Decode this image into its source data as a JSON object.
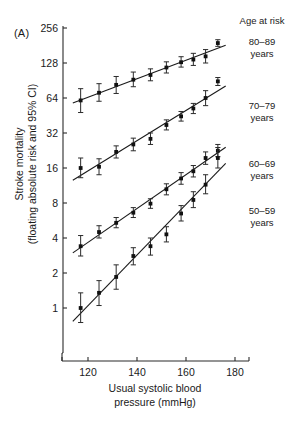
{
  "figure": {
    "panel_label": "(A)",
    "background": "#ffffff",
    "ink_color": "#1a1a1a"
  },
  "legend": {
    "title": "Age at risk",
    "position": "right",
    "entries": [
      {
        "age_range": "80–89",
        "unit": "years",
        "label_top": 36
      },
      {
        "age_range": "70–79",
        "unit": "years",
        "label_top": 100
      },
      {
        "age_range": "60–69",
        "unit": "years",
        "label_top": 158
      },
      {
        "age_range": "50–59",
        "unit": "years",
        "label_top": 205
      }
    ]
  },
  "chart_data": {
    "type": "scatter",
    "title": "",
    "subtitle": "",
    "xlabel_line1": "Usual systolic blood",
    "xlabel_line2": "pressure (mmHg)",
    "ylabel_line1": "Stroke mortality",
    "ylabel_line2": "(floating absolute risk and 95% CI)",
    "xlim": [
      112,
      188
    ],
    "ylim": [
      0.62,
      300
    ],
    "yscale": "log2",
    "xticks": [
      120,
      140,
      160,
      180
    ],
    "yticks": [
      1,
      2,
      4,
      8,
      16,
      32,
      64,
      128,
      256
    ],
    "ytick_labels": [
      "1",
      "2",
      "4",
      "8",
      "16",
      "32",
      "64",
      "128",
      "256"
    ],
    "grid": false,
    "legend_position": "right",
    "errorbar": "95% CI",
    "series": [
      {
        "name": "80–89 years",
        "x": [
          117,
          124.5,
          131.5,
          138.5,
          145.5,
          152,
          158,
          163,
          168,
          173
        ],
        "values": [
          61,
          71,
          83,
          92,
          101,
          117,
          130,
          137,
          146,
          190
        ],
        "ci_low": [
          48,
          60,
          70,
          80,
          90,
          105,
          118,
          122,
          128,
          178
        ],
        "ci_high": [
          77,
          85,
          98,
          107,
          114,
          131,
          145,
          155,
          167,
          203
        ]
      },
      {
        "name": "70–79 years",
        "x": [
          117,
          124.5,
          131.5,
          138.5,
          145.5,
          152,
          158,
          163,
          168,
          173
        ],
        "values": [
          16.0,
          16.4,
          22.0,
          25.5,
          28.5,
          37.5,
          44.5,
          52.0,
          64.0,
          89.0
        ],
        "ci_low": [
          13.2,
          14.0,
          19.5,
          22.5,
          25.5,
          34.0,
          40.5,
          47.0,
          55.0,
          82.0
        ],
        "ci_high": [
          19.5,
          19.2,
          24.8,
          28.9,
          32.0,
          41.5,
          49.0,
          57.5,
          74.0,
          96.0
        ]
      },
      {
        "name": "60–69 years",
        "x": [
          117,
          124.5,
          131.5,
          138.5,
          145.5,
          152,
          158,
          163,
          168,
          173
        ],
        "values": [
          3.4,
          4.5,
          5.4,
          6.6,
          7.9,
          10.5,
          13.0,
          15.0,
          19.5,
          22.5
        ],
        "ci_low": [
          2.8,
          4.0,
          4.9,
          6.0,
          7.2,
          9.4,
          11.6,
          13.4,
          17.2,
          20.0
        ],
        "ci_high": [
          4.2,
          5.1,
          6.0,
          7.3,
          8.7,
          11.7,
          14.6,
          16.8,
          22.0,
          25.5
        ]
      },
      {
        "name": "50–59 years",
        "x": [
          117,
          124.5,
          131.5,
          138.5,
          145.5,
          152,
          158,
          163,
          168,
          173
        ],
        "values": [
          1.0,
          1.35,
          1.85,
          2.8,
          3.4,
          4.3,
          6.5,
          8.5,
          11.5,
          19.5
        ],
        "ci_low": [
          0.75,
          1.05,
          1.45,
          2.35,
          2.85,
          3.7,
          5.6,
          7.3,
          9.6,
          16.0
        ],
        "ci_high": [
          1.35,
          1.72,
          2.35,
          3.3,
          4.0,
          5.0,
          7.6,
          10.0,
          14.0,
          24.0
        ]
      }
    ]
  }
}
